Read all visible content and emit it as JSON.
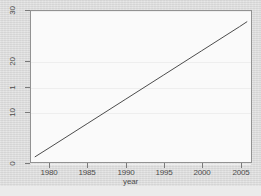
{
  "chart_data": {
    "type": "line",
    "title": "",
    "subtitle": "",
    "xlabel": "year",
    "ylabel": "",
    "xlim": [
      1977.5,
      2006.5
    ],
    "ylim": [
      0,
      30
    ],
    "grid": true,
    "legend": null,
    "xticks": [
      1980,
      1985,
      1990,
      1995,
      2000,
      2005
    ],
    "xtick_labels": [
      "1980",
      "1985",
      "1990",
      "1995",
      "2000",
      "2005"
    ],
    "yticks": [
      0,
      10,
      15,
      20,
      30
    ],
    "ytick_labels": [
      "0",
      "10",
      "1",
      "20",
      "30"
    ],
    "series": [
      {
        "name": "trend",
        "x": [
          1978,
          1980,
          1985,
          1990,
          1995,
          2000,
          2005,
          2006
        ],
        "values": [
          1.0,
          2.9,
          7.7,
          12.5,
          17.3,
          22.1,
          26.9,
          27.9
        ]
      }
    ],
    "line_color": "#3c3c3c",
    "panel_background": "#fdfdfd",
    "figure_background": "#dedede",
    "gridline_color": "#f0f0f0",
    "axis_color": "#8a8a8a"
  },
  "axis_titles": {
    "x": "year"
  }
}
